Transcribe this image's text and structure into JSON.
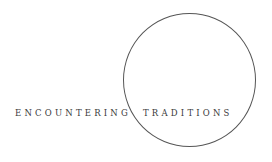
{
  "logo": {
    "word1": "ENCOUNTERING",
    "word2": "TRADITIONS",
    "circle_color": "#555555",
    "text_color": "#3a3a3a"
  }
}
